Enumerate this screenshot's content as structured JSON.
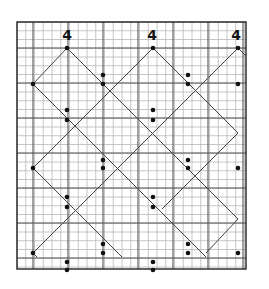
{
  "diagram": {
    "type": "grid-pattern",
    "grid": {
      "x0": 17,
      "y0": 22,
      "x1": 246,
      "y1": 269,
      "minor_step": 8.75,
      "major_every": 4,
      "major_x": [
        33,
        68,
        103,
        138,
        173,
        208,
        243
      ],
      "major_y": [
        48,
        83,
        118,
        153,
        188,
        223,
        258
      ]
    },
    "labels": [
      {
        "text": "4",
        "x": 67,
        "y": 40
      },
      {
        "text": "4",
        "x": 152,
        "y": 40
      },
      {
        "text": "4",
        "x": 236,
        "y": 40
      }
    ],
    "lines": [
      [
        67,
        48,
        33,
        84
      ],
      [
        67,
        48,
        238,
        219
      ],
      [
        153,
        48,
        33,
        168
      ],
      [
        153,
        48,
        238,
        133
      ],
      [
        238,
        48,
        33,
        253
      ],
      [
        238,
        48,
        269,
        79
      ],
      [
        33,
        84,
        206,
        257
      ],
      [
        33,
        168,
        122,
        257
      ],
      [
        33,
        253,
        37,
        257
      ],
      [
        238,
        133,
        162,
        209
      ],
      [
        238,
        219,
        206,
        253
      ]
    ],
    "points": [
      [
        67,
        48
      ],
      [
        153,
        48
      ],
      [
        238,
        48
      ],
      [
        33,
        84
      ],
      [
        103,
        75
      ],
      [
        103,
        84
      ],
      [
        188,
        75
      ],
      [
        188,
        84
      ],
      [
        238,
        84
      ],
      [
        67,
        110
      ],
      [
        67,
        120
      ],
      [
        153,
        110
      ],
      [
        153,
        120
      ],
      [
        33,
        168
      ],
      [
        103,
        160
      ],
      [
        103,
        168
      ],
      [
        188,
        160
      ],
      [
        188,
        168
      ],
      [
        238,
        168
      ],
      [
        67,
        197
      ],
      [
        67,
        207
      ],
      [
        153,
        197
      ],
      [
        153,
        207
      ],
      [
        33,
        253
      ],
      [
        103,
        244
      ],
      [
        103,
        253
      ],
      [
        188,
        244
      ],
      [
        188,
        253
      ],
      [
        238,
        253
      ],
      [
        67,
        262
      ],
      [
        67,
        270
      ],
      [
        153,
        262
      ],
      [
        153,
        270
      ]
    ],
    "colors": {
      "grid_minor": "#b8b8b8",
      "grid_major": "#555555",
      "line": "#444444",
      "dot": "#111111"
    }
  }
}
